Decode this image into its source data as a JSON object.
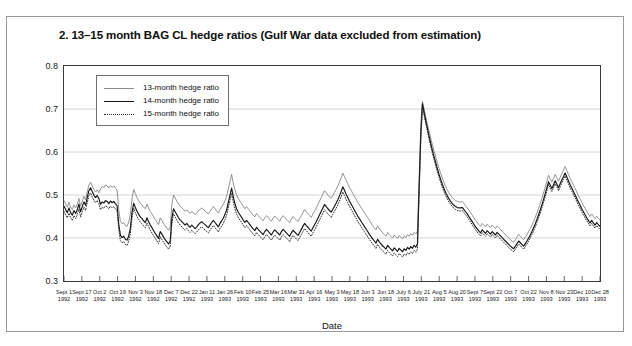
{
  "figure": {
    "title": "2. 13–15 month BAG CL hedge ratios (Gulf War data excluded from estimation)"
  },
  "chart_data": {
    "type": "line",
    "title": "2. 13–15 month BAG CL hedge ratios (Gulf War data excluded from estimation)",
    "xlabel": "Date",
    "ylabel": "Hedge ratio",
    "ylim": [
      0.3,
      0.8
    ],
    "yticks": [
      "0.3",
      "0.4",
      "0.5",
      "0.6",
      "0.7",
      "0.8"
    ],
    "grid": "horizontal",
    "legend_position": "top-left-inside",
    "xtick_labels": [
      {
        "d": "Sept 1",
        "y": "1992"
      },
      {
        "d": "Sept 17",
        "y": "1992"
      },
      {
        "d": "Oct 2",
        "y": "1992"
      },
      {
        "d": "Oct 19",
        "y": "1992"
      },
      {
        "d": "Nov 3",
        "y": "1992"
      },
      {
        "d": "Nov 18",
        "y": "1992"
      },
      {
        "d": "Dec 7",
        "y": "1992"
      },
      {
        "d": "Dec 22",
        "y": "1992"
      },
      {
        "d": "Jan 11",
        "y": "1993"
      },
      {
        "d": "Jan 26",
        "y": "1993"
      },
      {
        "d": "Feb 10",
        "y": "1993"
      },
      {
        "d": "Feb 25",
        "y": "1993"
      },
      {
        "d": "Mar 16",
        "y": "1993"
      },
      {
        "d": "Mar 31",
        "y": "1993"
      },
      {
        "d": "Apr 16",
        "y": "1993"
      },
      {
        "d": "May 3",
        "y": "1993"
      },
      {
        "d": "May 18",
        "y": "1993"
      },
      {
        "d": "Jun 3",
        "y": "1993"
      },
      {
        "d": "Jun 18",
        "y": "1993"
      },
      {
        "d": "July 6",
        "y": "1993"
      },
      {
        "d": "July 21",
        "y": "1993"
      },
      {
        "d": "Aug 5",
        "y": "1993"
      },
      {
        "d": "Aug 20",
        "y": "1993"
      },
      {
        "d": "Sept 7",
        "y": "1993"
      },
      {
        "d": "Sept 22",
        "y": "1993"
      },
      {
        "d": "Oct 7",
        "y": "1993"
      },
      {
        "d": "Oct 22",
        "y": "1993"
      },
      {
        "d": "Nov 8",
        "y": "1993"
      },
      {
        "d": "Nov 23",
        "y": "1993"
      },
      {
        "d": "Dec 10",
        "y": "1993"
      },
      {
        "d": "Dec 28",
        "y": "1993"
      }
    ],
    "series": [
      {
        "name": "13-month hedge ratio",
        "color": "#8c8c8c",
        "style": "solid",
        "values": [
          0.487,
          0.479,
          0.472,
          0.483,
          0.472,
          0.466,
          0.477,
          0.47,
          0.479,
          0.492,
          0.474,
          0.486,
          0.497,
          0.489,
          0.507,
          0.523,
          0.53,
          0.521,
          0.513,
          0.507,
          0.512,
          0.505,
          0.514,
          0.52,
          0.517,
          0.523,
          0.521,
          0.516,
          0.522,
          0.518,
          0.521,
          0.516,
          0.511,
          0.466,
          0.438,
          0.433,
          0.436,
          0.429,
          0.427,
          0.437,
          0.455,
          0.492,
          0.513,
          0.503,
          0.494,
          0.487,
          0.481,
          0.477,
          0.472,
          0.468,
          0.479,
          0.47,
          0.462,
          0.456,
          0.449,
          0.443,
          0.437,
          0.431,
          0.447,
          0.441,
          0.434,
          0.428,
          0.423,
          0.418,
          0.425,
          0.477,
          0.5,
          0.493,
          0.486,
          0.479,
          0.474,
          0.47,
          0.466,
          0.462,
          0.466,
          0.461,
          0.457,
          0.462,
          0.458,
          0.454,
          0.458,
          0.463,
          0.467,
          0.47,
          0.466,
          0.463,
          0.459,
          0.456,
          0.462,
          0.468,
          0.473,
          0.468,
          0.463,
          0.458,
          0.466,
          0.472,
          0.478,
          0.487,
          0.497,
          0.514,
          0.531,
          0.548,
          0.528,
          0.512,
          0.5,
          0.492,
          0.486,
          0.48,
          0.474,
          0.468,
          0.473,
          0.468,
          0.463,
          0.458,
          0.453,
          0.449,
          0.457,
          0.452,
          0.448,
          0.444,
          0.44,
          0.447,
          0.452,
          0.448,
          0.443,
          0.439,
          0.446,
          0.451,
          0.447,
          0.443,
          0.439,
          0.447,
          0.452,
          0.448,
          0.444,
          0.44,
          0.436,
          0.444,
          0.45,
          0.446,
          0.442,
          0.438,
          0.445,
          0.452,
          0.459,
          0.466,
          0.461,
          0.457,
          0.452,
          0.448,
          0.456,
          0.463,
          0.47,
          0.478,
          0.486,
          0.494,
          0.502,
          0.51,
          0.505,
          0.5,
          0.496,
          0.492,
          0.499,
          0.506,
          0.513,
          0.521,
          0.53,
          0.54,
          0.551,
          0.543,
          0.534,
          0.526,
          0.518,
          0.511,
          0.504,
          0.497,
          0.49,
          0.483,
          0.477,
          0.471,
          0.465,
          0.459,
          0.453,
          0.447,
          0.441,
          0.435,
          0.429,
          0.424,
          0.419,
          0.428,
          0.422,
          0.417,
          0.412,
          0.408,
          0.404,
          0.413,
          0.408,
          0.404,
          0.4,
          0.407,
          0.403,
          0.399,
          0.406,
          0.402,
          0.398,
          0.405,
          0.401,
          0.408,
          0.404,
          0.41,
          0.406,
          0.413,
          0.409,
          0.416,
          0.54,
          0.66,
          0.718,
          0.7,
          0.682,
          0.665,
          0.648,
          0.632,
          0.617,
          0.602,
          0.588,
          0.575,
          0.562,
          0.55,
          0.539,
          0.529,
          0.52,
          0.512,
          0.505,
          0.499,
          0.494,
          0.49,
          0.487,
          0.485,
          0.484,
          0.484,
          0.485,
          0.48,
          0.475,
          0.47,
          0.465,
          0.459,
          0.453,
          0.447,
          0.441,
          0.436,
          0.431,
          0.427,
          0.434,
          0.43,
          0.426,
          0.432,
          0.428,
          0.424,
          0.43,
          0.426,
          0.422,
          0.428,
          0.424,
          0.42,
          0.416,
          0.412,
          0.408,
          0.404,
          0.4,
          0.396,
          0.393,
          0.39,
          0.396,
          0.402,
          0.408,
          0.404,
          0.4,
          0.396,
          0.402,
          0.408,
          0.415,
          0.422,
          0.43,
          0.439,
          0.448,
          0.458,
          0.469,
          0.48,
          0.492,
          0.505,
          0.518,
          0.532,
          0.546,
          0.538,
          0.53,
          0.539,
          0.548,
          0.54,
          0.532,
          0.541,
          0.55,
          0.558,
          0.566,
          0.557,
          0.548,
          0.539,
          0.531,
          0.523,
          0.515,
          0.507,
          0.499,
          0.491,
          0.483,
          0.476,
          0.469,
          0.462,
          0.456,
          0.45,
          0.456,
          0.45,
          0.445,
          0.451,
          0.446,
          0.442
        ]
      },
      {
        "name": "14-month hedge ratio",
        "color": "#141414",
        "style": "solid",
        "values": [
          0.474,
          0.466,
          0.459,
          0.47,
          0.459,
          0.453,
          0.464,
          0.457,
          0.466,
          0.479,
          0.461,
          0.473,
          0.484,
          0.476,
          0.494,
          0.51,
          0.517,
          0.508,
          0.5,
          0.494,
          0.499,
          0.492,
          0.478,
          0.484,
          0.481,
          0.487,
          0.485,
          0.48,
          0.486,
          0.482,
          0.485,
          0.48,
          0.475,
          0.432,
          0.406,
          0.401,
          0.404,
          0.397,
          0.395,
          0.405,
          0.423,
          0.46,
          0.481,
          0.471,
          0.462,
          0.455,
          0.449,
          0.445,
          0.44,
          0.436,
          0.447,
          0.438,
          0.43,
          0.424,
          0.417,
          0.411,
          0.405,
          0.399,
          0.415,
          0.409,
          0.402,
          0.396,
          0.391,
          0.386,
          0.393,
          0.445,
          0.468,
          0.461,
          0.454,
          0.447,
          0.442,
          0.438,
          0.434,
          0.43,
          0.434,
          0.429,
          0.425,
          0.43,
          0.426,
          0.422,
          0.426,
          0.431,
          0.435,
          0.438,
          0.434,
          0.431,
          0.427,
          0.424,
          0.43,
          0.436,
          0.441,
          0.436,
          0.431,
          0.426,
          0.434,
          0.44,
          0.446,
          0.455,
          0.465,
          0.482,
          0.499,
          0.516,
          0.496,
          0.48,
          0.468,
          0.46,
          0.454,
          0.448,
          0.442,
          0.436,
          0.441,
          0.436,
          0.431,
          0.426,
          0.421,
          0.417,
          0.425,
          0.42,
          0.416,
          0.412,
          0.408,
          0.415,
          0.42,
          0.416,
          0.411,
          0.407,
          0.414,
          0.419,
          0.415,
          0.411,
          0.407,
          0.415,
          0.42,
          0.416,
          0.412,
          0.408,
          0.404,
          0.412,
          0.418,
          0.414,
          0.41,
          0.406,
          0.413,
          0.42,
          0.427,
          0.434,
          0.429,
          0.425,
          0.42,
          0.416,
          0.424,
          0.431,
          0.438,
          0.446,
          0.454,
          0.462,
          0.47,
          0.478,
          0.473,
          0.468,
          0.464,
          0.46,
          0.467,
          0.474,
          0.481,
          0.489,
          0.498,
          0.508,
          0.519,
          0.511,
          0.502,
          0.494,
          0.486,
          0.479,
          0.472,
          0.465,
          0.458,
          0.451,
          0.445,
          0.439,
          0.433,
          0.427,
          0.421,
          0.415,
          0.409,
          0.403,
          0.398,
          0.393,
          0.388,
          0.397,
          0.391,
          0.386,
          0.382,
          0.378,
          0.374,
          0.383,
          0.378,
          0.374,
          0.37,
          0.377,
          0.373,
          0.369,
          0.376,
          0.372,
          0.368,
          0.375,
          0.371,
          0.378,
          0.374,
          0.38,
          0.376,
          0.383,
          0.379,
          0.386,
          0.515,
          0.64,
          0.712,
          0.692,
          0.673,
          0.655,
          0.637,
          0.62,
          0.604,
          0.589,
          0.575,
          0.561,
          0.548,
          0.536,
          0.525,
          0.515,
          0.506,
          0.498,
          0.491,
          0.485,
          0.48,
          0.476,
          0.473,
          0.471,
          0.47,
          0.47,
          0.471,
          0.466,
          0.461,
          0.456,
          0.45,
          0.444,
          0.438,
          0.432,
          0.426,
          0.421,
          0.416,
          0.412,
          0.419,
          0.415,
          0.411,
          0.417,
          0.413,
          0.409,
          0.415,
          0.411,
          0.407,
          0.413,
          0.409,
          0.405,
          0.401,
          0.397,
          0.393,
          0.389,
          0.385,
          0.381,
          0.378,
          0.375,
          0.381,
          0.387,
          0.393,
          0.389,
          0.385,
          0.381,
          0.387,
          0.393,
          0.4,
          0.407,
          0.415,
          0.424,
          0.433,
          0.443,
          0.454,
          0.465,
          0.477,
          0.49,
          0.503,
          0.517,
          0.531,
          0.523,
          0.515,
          0.524,
          0.533,
          0.525,
          0.517,
          0.526,
          0.535,
          0.543,
          0.551,
          0.542,
          0.533,
          0.524,
          0.516,
          0.508,
          0.5,
          0.492,
          0.484,
          0.476,
          0.468,
          0.461,
          0.454,
          0.447,
          0.441,
          0.435,
          0.441,
          0.435,
          0.43,
          0.436,
          0.431,
          0.427
        ]
      },
      {
        "name": "15-month hedge ratio",
        "color": "#2b2b2b",
        "style": "dotted",
        "values": [
          0.462,
          0.454,
          0.447,
          0.458,
          0.447,
          0.441,
          0.452,
          0.445,
          0.454,
          0.467,
          0.449,
          0.461,
          0.472,
          0.464,
          0.482,
          0.498,
          0.505,
          0.496,
          0.488,
          0.482,
          0.487,
          0.48,
          0.466,
          0.472,
          0.469,
          0.475,
          0.473,
          0.468,
          0.474,
          0.47,
          0.473,
          0.468,
          0.463,
          0.42,
          0.394,
          0.389,
          0.392,
          0.385,
          0.383,
          0.393,
          0.411,
          0.448,
          0.469,
          0.459,
          0.45,
          0.443,
          0.437,
          0.433,
          0.428,
          0.424,
          0.435,
          0.426,
          0.418,
          0.412,
          0.405,
          0.399,
          0.393,
          0.387,
          0.403,
          0.397,
          0.39,
          0.384,
          0.379,
          0.374,
          0.381,
          0.433,
          0.456,
          0.449,
          0.442,
          0.435,
          0.43,
          0.426,
          0.422,
          0.418,
          0.422,
          0.417,
          0.413,
          0.418,
          0.414,
          0.41,
          0.414,
          0.419,
          0.423,
          0.426,
          0.422,
          0.419,
          0.415,
          0.412,
          0.418,
          0.424,
          0.429,
          0.424,
          0.419,
          0.414,
          0.422,
          0.428,
          0.434,
          0.443,
          0.453,
          0.47,
          0.487,
          0.504,
          0.484,
          0.468,
          0.456,
          0.448,
          0.442,
          0.436,
          0.43,
          0.424,
          0.429,
          0.424,
          0.419,
          0.414,
          0.409,
          0.405,
          0.413,
          0.408,
          0.404,
          0.4,
          0.396,
          0.403,
          0.408,
          0.404,
          0.399,
          0.395,
          0.402,
          0.407,
          0.403,
          0.399,
          0.395,
          0.403,
          0.408,
          0.404,
          0.4,
          0.396,
          0.392,
          0.4,
          0.406,
          0.402,
          0.398,
          0.394,
          0.401,
          0.408,
          0.415,
          0.422,
          0.417,
          0.413,
          0.408,
          0.404,
          0.412,
          0.419,
          0.426,
          0.434,
          0.442,
          0.45,
          0.458,
          0.466,
          0.461,
          0.456,
          0.452,
          0.448,
          0.455,
          0.462,
          0.469,
          0.477,
          0.486,
          0.496,
          0.507,
          0.499,
          0.49,
          0.482,
          0.474,
          0.467,
          0.46,
          0.453,
          0.446,
          0.439,
          0.433,
          0.427,
          0.421,
          0.415,
          0.409,
          0.403,
          0.397,
          0.391,
          0.386,
          0.381,
          0.376,
          0.385,
          0.379,
          0.374,
          0.37,
          0.366,
          0.362,
          0.371,
          0.366,
          0.362,
          0.358,
          0.365,
          0.361,
          0.357,
          0.364,
          0.36,
          0.356,
          0.363,
          0.359,
          0.366,
          0.362,
          0.368,
          0.364,
          0.371,
          0.367,
          0.374,
          0.5,
          0.626,
          0.705,
          0.685,
          0.666,
          0.648,
          0.63,
          0.613,
          0.597,
          0.582,
          0.568,
          0.554,
          0.541,
          0.529,
          0.518,
          0.508,
          0.499,
          0.491,
          0.484,
          0.478,
          0.473,
          0.469,
          0.466,
          0.464,
          0.463,
          0.463,
          0.464,
          0.459,
          0.454,
          0.449,
          0.443,
          0.437,
          0.431,
          0.425,
          0.419,
          0.414,
          0.409,
          0.405,
          0.412,
          0.408,
          0.404,
          0.41,
          0.406,
          0.402,
          0.408,
          0.404,
          0.4,
          0.406,
          0.402,
          0.398,
          0.394,
          0.39,
          0.386,
          0.382,
          0.378,
          0.374,
          0.371,
          0.368,
          0.374,
          0.38,
          0.386,
          0.382,
          0.378,
          0.374,
          0.38,
          0.386,
          0.393,
          0.4,
          0.408,
          0.417,
          0.426,
          0.436,
          0.447,
          0.458,
          0.47,
          0.483,
          0.496,
          0.51,
          0.524,
          0.516,
          0.508,
          0.517,
          0.526,
          0.518,
          0.51,
          0.519,
          0.528,
          0.536,
          0.544,
          0.535,
          0.526,
          0.517,
          0.509,
          0.501,
          0.493,
          0.485,
          0.477,
          0.469,
          0.461,
          0.454,
          0.447,
          0.44,
          0.434,
          0.428,
          0.434,
          0.428,
          0.423,
          0.429,
          0.424,
          0.42
        ]
      }
    ]
  }
}
